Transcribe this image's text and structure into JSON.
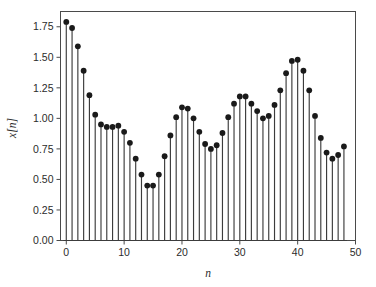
{
  "chart_data": {
    "type": "stem",
    "title": "",
    "subtitle": "",
    "xlabel": "n",
    "ylabel": "x[n]",
    "xlim": [
      -1,
      50
    ],
    "ylim": [
      0.0,
      1.875
    ],
    "grid": false,
    "legend": null,
    "xticks": [
      0,
      10,
      20,
      30,
      40,
      50
    ],
    "xtick_labels": [
      "0",
      "10",
      "20",
      "30",
      "40",
      "50"
    ],
    "yticks": [
      0.0,
      0.25,
      0.5,
      0.75,
      1.0,
      1.25,
      1.5,
      1.75
    ],
    "ytick_labels": [
      "0.00",
      "0.25",
      "0.50",
      "0.75",
      "1.00",
      "1.25",
      "1.50",
      "1.75"
    ],
    "marker": "filled-circle",
    "marker_color": "#1a1a1a",
    "stem_color": "#3c3c3c",
    "baseline": 0.0,
    "x": [
      0,
      1,
      2,
      3,
      4,
      5,
      6,
      7,
      8,
      9,
      10,
      11,
      12,
      13,
      14,
      15,
      16,
      17,
      18,
      19,
      20,
      21,
      22,
      23,
      24,
      25,
      26,
      27,
      28,
      29,
      30,
      31,
      32,
      33,
      34,
      35,
      36,
      37,
      38,
      39,
      40,
      41,
      42,
      43,
      44,
      45,
      46,
      47,
      48
    ],
    "values": [
      1.79,
      1.74,
      1.59,
      1.39,
      1.19,
      1.03,
      0.95,
      0.93,
      0.93,
      0.94,
      0.89,
      0.8,
      0.67,
      0.54,
      0.45,
      0.45,
      0.54,
      0.69,
      0.86,
      1.01,
      1.09,
      1.08,
      1.0,
      0.89,
      0.79,
      0.75,
      0.78,
      0.88,
      1.01,
      1.12,
      1.18,
      1.18,
      1.12,
      1.06,
      1.0,
      1.02,
      1.11,
      1.23,
      1.37,
      1.47,
      1.48,
      1.39,
      1.23,
      1.02,
      0.84,
      0.72,
      0.67,
      0.7,
      0.77
    ]
  },
  "axes": {
    "frame_color": "#4a4a4a",
    "background": "#ffffff"
  }
}
